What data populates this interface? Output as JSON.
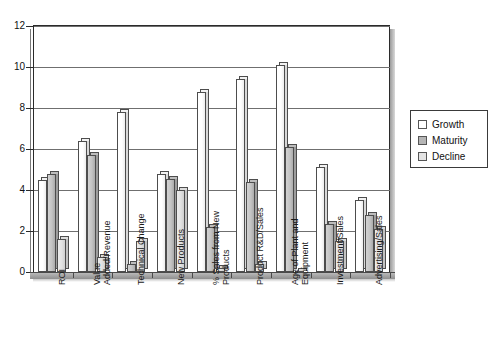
{
  "chart_data": {
    "type": "bar",
    "title": "",
    "subtitle": "",
    "xlabel": "",
    "ylabel": "",
    "ylim": [
      0,
      12
    ],
    "ytick_step": 2,
    "yticks": [
      "0",
      "2",
      "4",
      "6",
      "8",
      "10",
      "12"
    ],
    "grid": true,
    "grid_axis": "y",
    "legend_position": "right",
    "orientation": "vertical",
    "grouping": "grouped",
    "style_3d": true,
    "xtick_label_rotation": 90,
    "categories": [
      "ROI",
      "Value Added/Revenue",
      "Technical Change",
      "New Products",
      "% Sales from New Products",
      "Product R&D/Sales",
      "Age of Plant and Equipment",
      "Investment/Sales",
      "Advertising/Sales"
    ],
    "category_label_lines": [
      [
        "ROI"
      ],
      [
        "Value",
        "Added/Revenue"
      ],
      [
        "Technical Change"
      ],
      [
        "New Products"
      ],
      [
        "% Sales from New",
        "Products"
      ],
      [
        "Product R&D/Sales"
      ],
      [
        "Age of Plant and",
        "Equipment"
      ],
      [
        "Investment/Sales"
      ],
      [
        "Advertising/Sales"
      ]
    ],
    "series": [
      {
        "name": "Growth",
        "color": "#ffffff",
        "values": [
          4.5,
          6.4,
          7.8,
          4.8,
          8.8,
          9.4,
          10.1,
          5.1,
          3.5
        ]
      },
      {
        "name": "Maturity",
        "color": "#b5b5b5",
        "values": [
          4.8,
          5.7,
          0.4,
          4.55,
          2.2,
          4.4,
          6.1,
          2.35,
          2.8
        ]
      },
      {
        "name": "Decline",
        "color": "#e3e3e3",
        "values": [
          1.6,
          0.75,
          1.5,
          4.0,
          0.2,
          0.4,
          0.05,
          1.5,
          2.1
        ]
      }
    ]
  },
  "legend": {
    "items": [
      {
        "label": "Growth",
        "swatch": "growth"
      },
      {
        "label": "Maturity",
        "swatch": "maturity"
      },
      {
        "label": "Decline",
        "swatch": "decline"
      }
    ]
  }
}
